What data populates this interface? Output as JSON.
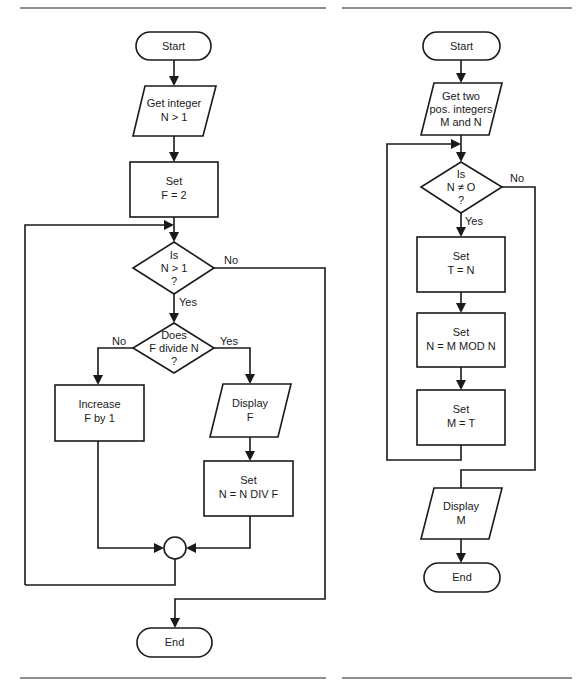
{
  "chart_left": {
    "title": "Prime factorization flowchart",
    "start": "Start",
    "input": [
      "Get integer",
      "N > 1"
    ],
    "init": [
      "Set",
      "F = 2"
    ],
    "decision1": [
      "Is",
      "N > 1",
      "?"
    ],
    "decision1_yes": "Yes",
    "decision1_no": "No",
    "decision2": [
      "Does",
      "F divide N",
      "?"
    ],
    "decision2_yes": "Yes",
    "decision2_no": "No",
    "increase": [
      "Increase",
      "F by 1"
    ],
    "display": [
      "Display",
      "F"
    ],
    "divide": [
      "Set",
      "N = N DIV F"
    ],
    "end": "End"
  },
  "chart_right": {
    "title": "Euclid GCD flowchart",
    "start": "Start",
    "input": [
      "Get two",
      "pos.  integers",
      "M and N"
    ],
    "decision": [
      "Is",
      "N  ≠  O",
      "?"
    ],
    "decision_yes": "Yes",
    "decision_no": "No",
    "step1": [
      "Set",
      "T = N"
    ],
    "step2": [
      "Set",
      "N = M MOD N"
    ],
    "step3": [
      "Set",
      "M = T"
    ],
    "display": [
      "Display",
      "M"
    ],
    "end": "End"
  },
  "colors": {
    "stroke": "#1a1a1a",
    "rule": "#6a6a6a",
    "background": "#ffffff"
  }
}
